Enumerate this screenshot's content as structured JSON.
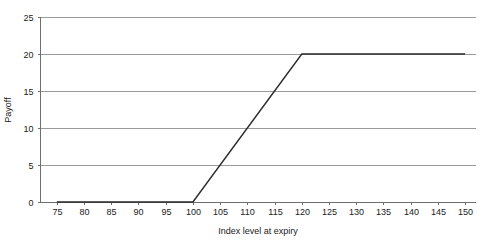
{
  "chart_data": {
    "type": "line",
    "title": "",
    "xlabel": "Index level at expiry",
    "ylabel": "Payoff",
    "xlim": [
      72,
      152
    ],
    "ylim": [
      0,
      25
    ],
    "grid": true,
    "legend": false,
    "x_ticks": [
      75,
      80,
      85,
      90,
      95,
      100,
      105,
      110,
      115,
      120,
      125,
      130,
      135,
      140,
      145,
      150
    ],
    "y_ticks": [
      0,
      5,
      10,
      15,
      20,
      25
    ],
    "series": [
      {
        "name": "Payoff",
        "color": "#2b2b2b",
        "x": [
          75,
          100,
          120,
          150
        ],
        "values": [
          0,
          0,
          20,
          20
        ]
      }
    ],
    "annotations": []
  },
  "axes": {
    "x_title": "Index level at expiry",
    "y_title": "Payoff",
    "x_tick_labels": [
      "75",
      "80",
      "85",
      "90",
      "95",
      "100",
      "105",
      "110",
      "115",
      "120",
      "125",
      "130",
      "135",
      "140",
      "145",
      "150"
    ],
    "y_tick_labels": [
      "0",
      "5",
      "10",
      "15",
      "20",
      "25"
    ]
  },
  "colors": {
    "series": "#2b2b2b",
    "gridline": "#9a9a9a",
    "axis": "#6e6e6e",
    "background": "#ffffff",
    "text": "#1a1a1a"
  }
}
